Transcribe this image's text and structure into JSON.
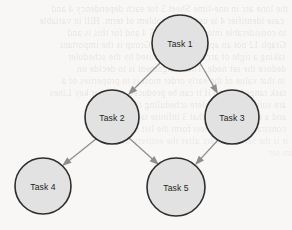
{
  "diagram": {
    "type": "directed-acyclic-graph",
    "background_color": "#f8f7f5",
    "node_fill_color": "#e2e2e2",
    "node_stroke_color": "#2e2e2e",
    "edge_color": "#8e8e8e",
    "label_color": "#222222",
    "nodes": [
      {
        "id": "task1",
        "label": "Task 1",
        "cx": 180,
        "cy": 43,
        "r": 28
      },
      {
        "id": "task2",
        "label": "Task 2",
        "cx": 112,
        "cy": 117,
        "r": 27
      },
      {
        "id": "task3",
        "label": "Task 3",
        "cx": 232,
        "cy": 117,
        "r": 27
      },
      {
        "id": "task4",
        "label": "Task 4",
        "cx": 43,
        "cy": 186,
        "r": 28
      },
      {
        "id": "task5",
        "label": "Task 5",
        "cx": 176,
        "cy": 187,
        "r": 29
      }
    ],
    "edges": [
      {
        "id": "e1",
        "from": "task1",
        "to": "task2",
        "x1": 160,
        "y1": 63,
        "x2": 128,
        "y2": 95,
        "directed": true
      },
      {
        "id": "e2",
        "from": "task1",
        "to": "task3",
        "x1": 200,
        "y1": 63,
        "x2": 218,
        "y2": 94,
        "directed": true
      },
      {
        "id": "e3",
        "from": "task2",
        "to": "task4",
        "x1": 96,
        "y1": 139,
        "x2": 62,
        "y2": 166,
        "directed": true
      },
      {
        "id": "e4",
        "from": "task2",
        "to": "task5",
        "x1": 129,
        "y1": 138,
        "x2": 159,
        "y2": 165,
        "directed": true
      },
      {
        "id": "e5",
        "from": "task3",
        "to": "task5",
        "x1": 218,
        "y1": 140,
        "x2": 195,
        "y2": 165,
        "directed": true
      }
    ]
  },
  "ghost_text": {
    "lines": [
      {
        "text": "the lone arc in one-lime Sheet 5 for each dependency 4 and",
        "x": 8,
        "y": 4,
        "size": 9.5,
        "opacity": 0.16
      },
      {
        "text": "case identifier 4 is usually a problem of term. Hill in variable",
        "x": 4,
        "y": 16,
        "size": 9.5,
        "opacity": 0.17
      },
      {
        "text": "to considerable into the task E = 5 4 and for this is and",
        "x": 6,
        "y": 28,
        "size": 9.5,
        "opacity": 0.15
      },
      {
        "text": "Graph 12 not an appropriate. The Group is the important",
        "x": 6,
        "y": 40,
        "size": 9.5,
        "opacity": 0.16
      },
      {
        "text": "taking a tight of arcs that can be used by the scheduler",
        "x": 5,
        "y": 52,
        "size": 9.5,
        "opacity": 0.15
      },
      {
        "text": "deduce the set node. This assignment is to decide on",
        "x": 6,
        "y": 64,
        "size": 9.5,
        "opacity": 0.16
      },
      {
        "text": "in that value of the early order most is to properties of a",
        "x": 5,
        "y": 76,
        "size": 9.5,
        "opacity": 0.15
      },
      {
        "text": "task ranged in and if it can be produced and over key Lines",
        "x": 6,
        "y": 88,
        "size": 9.5,
        "opacity": 0.16
      },
      {
        "text": "are suitably to complete scheduling this may",
        "x": 6,
        "y": 100,
        "size": 9.5,
        "opacity": 0.15
      },
      {
        "text": "and a the time the 3 that 3 infinite takes it this is",
        "x": 6,
        "y": 112,
        "size": 9.5,
        "opacity": 0.15
      },
      {
        "text": "constraint is the easiest form the list of tasks that",
        "x": 6,
        "y": 124,
        "size": 9.5,
        "opacity": 0.14
      },
      {
        "text": "it is the set of this arc after the entirety of",
        "x": 8,
        "y": 136,
        "size": 9.5,
        "opacity": 0.13
      },
      {
        "text": "of the main set",
        "x": 48,
        "y": 148,
        "size": 9.5,
        "opacity": 0.12
      }
    ]
  }
}
